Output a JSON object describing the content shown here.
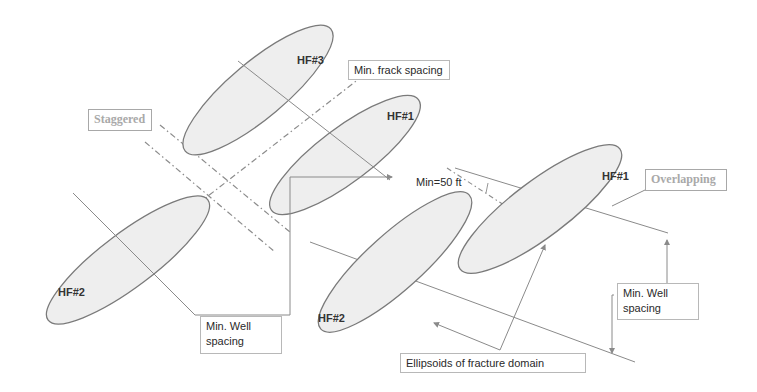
{
  "diagram": {
    "colors": {
      "ellipse_fill": "#eeeeee",
      "ellipse_stroke": "#7a7a7a",
      "line": "#8a8a8a",
      "dashdot": "#8c8c8c",
      "label_text": "#2a2a2a",
      "scenario_text": "#a9a9a9"
    },
    "staggered": {
      "label": "Staggered",
      "fractures": [
        {
          "id": "HF#3",
          "label": "HF#3"
        },
        {
          "id": "HF#1",
          "label": "HF#1"
        },
        {
          "id": "HF#2",
          "label": "HF#2"
        }
      ],
      "annotations": {
        "frack_spacing": "Min. frack  spacing",
        "well_spacing_line1": "Min. Well",
        "well_spacing_line2": "spacing"
      }
    },
    "overlapping": {
      "label": "Overlapping",
      "fractures": [
        {
          "id": "HF#1",
          "label": "HF#1"
        },
        {
          "id": "HF#2",
          "label": "HF#2"
        }
      ],
      "annotations": {
        "min_distance": "Min=50 ft",
        "well_spacing_line1": "Min. Well",
        "well_spacing_line2": "spacing",
        "ellipsoids": "Ellipsoids of  fracture domain"
      }
    }
  }
}
